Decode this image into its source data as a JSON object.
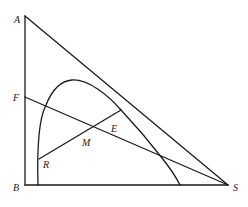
{
  "diagram": {
    "type": "geometry",
    "points": {
      "A": {
        "label": "A",
        "x": 25,
        "y": 16
      },
      "F": {
        "label": "F",
        "x": 25,
        "y": 97
      },
      "B": {
        "label": "B",
        "x": 25,
        "y": 185
      },
      "S": {
        "label": "S",
        "x": 228,
        "y": 185
      },
      "R": {
        "label": "R",
        "x": 39,
        "y": 159
      },
      "M": {
        "label": "M",
        "x": 92,
        "y": 126
      },
      "E": {
        "label": "E",
        "x": 121,
        "y": 110
      }
    },
    "labels": {
      "A": "A",
      "F": "F",
      "B": "B",
      "S": "S",
      "M": "M",
      "E": "E",
      "R": "R"
    },
    "segments": [
      {
        "from": "A",
        "to": "B"
      },
      {
        "from": "B",
        "to": "S"
      },
      {
        "from": "A",
        "to": "S"
      },
      {
        "from": "F",
        "to": "S"
      },
      {
        "from": "R",
        "to": "E"
      }
    ],
    "curve": {
      "description": "Arch-shaped curve from base near B rising to a peak and descending to base before S"
    },
    "stroke_color": "#1a1a1a",
    "background": "#ffffff"
  }
}
